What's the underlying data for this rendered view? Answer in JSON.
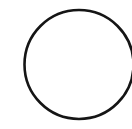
{
  "canvas": {
    "width": 132,
    "height": 129,
    "background_color": "#ffffff",
    "description": "Plain white canvas containing a single hand-drawn style circle outline"
  },
  "shapes": [
    {
      "name": "circle-outline",
      "type": "circle",
      "center_x": 79,
      "center_y": 64.5,
      "radius": 54.5,
      "stroke_color": "#151515",
      "stroke_width": 2.6,
      "fill_color": "none",
      "clipped_edge": "right",
      "label": "Circle"
    }
  ],
  "annotations": {
    "interior_text": "",
    "caption": ""
  }
}
